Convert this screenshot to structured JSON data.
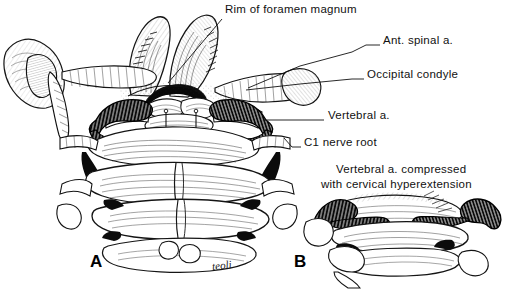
{
  "figure": {
    "background_color": "#ffffff",
    "ink_color": "#111111",
    "signature": "teoli"
  },
  "labels": [
    {
      "id": "rim-of-foramen-magnum",
      "text": "Rim of foramen magnum",
      "x": 225,
      "y": 8,
      "leader": {
        "x1": 222,
        "y1": 19,
        "x2": 168,
        "y2": 83
      }
    },
    {
      "id": "ant-spinal-artery",
      "text": "Ant. spinal a.",
      "x": 382,
      "y": 39,
      "leader": {
        "x1": 379,
        "y1": 45,
        "x2": 360,
        "y2": 45
      }
    },
    {
      "id": "occipital-condyle",
      "text": "Occipital condyle",
      "x": 366,
      "y": 73,
      "leader": {
        "x1": 363,
        "y1": 79,
        "x2": 245,
        "y2": 90
      }
    },
    {
      "id": "vertebral-artery",
      "text": "Vertebral a.",
      "x": 327,
      "y": 114,
      "leader": {
        "x1": 323,
        "y1": 120,
        "x2": 264,
        "y2": 120
      }
    },
    {
      "id": "c1-nerve-root",
      "text": "C1 nerve root",
      "x": 303,
      "y": 141,
      "leader": {
        "x1": 300,
        "y1": 147,
        "x2": 286,
        "y2": 139
      }
    }
  ],
  "caption": {
    "line1": "Vertebral a. compressed",
    "line2": "with cervical hyperextension",
    "line1_x": 336,
    "line1_y": 168,
    "line2_x": 321,
    "line2_y": 183
  },
  "panels": [
    {
      "id": "panel-a",
      "letter": "A",
      "x": 90,
      "y": 252,
      "description": "Neutral position: posterior view of occiput, C1 and C2 with vertebral arteries in sulcus arteriosus"
    },
    {
      "id": "panel-b",
      "letter": "B",
      "x": 294,
      "y": 252,
      "description": "Cervical hyperextension: vertebral arteries kinked and compressed between occiput and C1"
    }
  ],
  "signature": {
    "text": "teoli",
    "x": 212,
    "y": 264
  }
}
